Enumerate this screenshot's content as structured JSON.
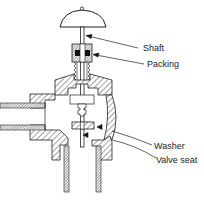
{
  "diagram": {
    "labels": {
      "shaft": "Shaft",
      "packing": "Packing",
      "washer": "Washer",
      "valve_seat": "Valve seat"
    },
    "colors": {
      "line": "#222222",
      "fill_dark": "#222222",
      "background": "#ffffff"
    }
  }
}
